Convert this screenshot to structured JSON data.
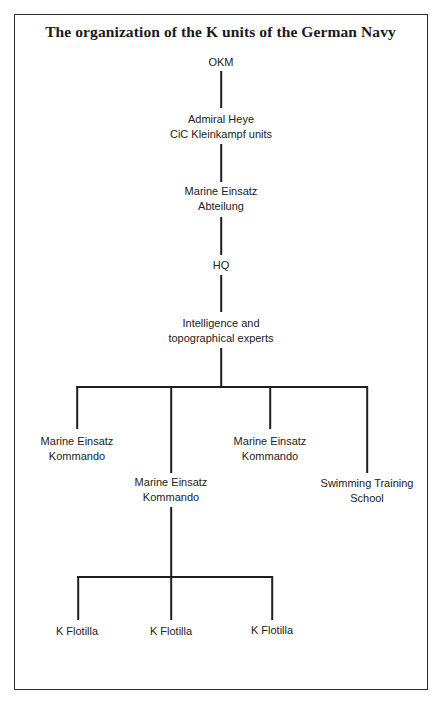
{
  "page": {
    "page_number_partial": "¹⁹"
  },
  "chart": {
    "title": "The organization of the K units of the German Navy"
  },
  "nodes": {
    "okm": {
      "lines": [
        "OKM"
      ]
    },
    "admiral": {
      "lines": [
        "Admiral Heye",
        "CiC Kleinkampf units"
      ]
    },
    "mea": {
      "lines": [
        "Marine Einsatz",
        "Abteilung"
      ]
    },
    "hq": {
      "lines": [
        "HQ"
      ]
    },
    "intel": {
      "lines": [
        "Intelligence and",
        "topographical experts"
      ]
    },
    "mek1": {
      "lines": [
        "Marine Einsatz",
        "Kommando"
      ]
    },
    "mek2": {
      "lines": [
        "Marine Einsatz",
        "Kommando"
      ]
    },
    "mek3": {
      "lines": [
        "Marine Einsatz",
        "Kommando"
      ]
    },
    "swim": {
      "lines": [
        "Swimming Training",
        "School"
      ]
    },
    "kf1": {
      "lines": [
        "K Flotilla"
      ]
    },
    "kf2": {
      "lines": [
        "K Flotilla"
      ]
    },
    "kf3": {
      "lines": [
        "K Flotilla"
      ]
    }
  },
  "hierarchy": {
    "OKM": [
      "Admiral Heye / CiC Kleinkampf units"
    ],
    "Admiral Heye / CiC Kleinkampf units": [
      "Marine Einsatz Abteilung"
    ],
    "Marine Einsatz Abteilung": [
      "HQ"
    ],
    "HQ": [
      "Intelligence and topographical experts"
    ],
    "Intelligence and topographical experts": [
      "Marine Einsatz Kommando (1)",
      "Marine Einsatz Kommando (2)",
      "Marine Einsatz Kommando (3)",
      "Swimming Training School"
    ],
    "Marine Einsatz Kommando (2)": [
      "K Flotilla (1)",
      "K Flotilla (2)",
      "K Flotilla (3)"
    ]
  }
}
